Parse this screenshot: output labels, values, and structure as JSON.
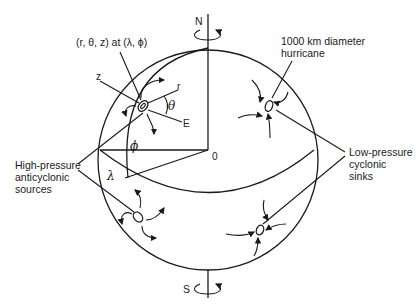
{
  "diagram": {
    "type": "earth-sphere-coordinate-diagram",
    "poles": {
      "north": "N",
      "south": "S"
    },
    "origin_label": "0",
    "coordinate_label": "(r, θ, z) at (λ, ϕ)",
    "axis_labels": {
      "z": "z",
      "r": "r",
      "east": "E",
      "theta": "θ",
      "phi": "ϕ",
      "lambda": "λ"
    },
    "annotations": {
      "hurricane": [
        "1000 km diameter",
        "hurricane"
      ],
      "high_pressure": [
        "High-pressure",
        "anticyclonic",
        "sources"
      ],
      "low_pressure": [
        "Low-pressure",
        "cyclonic",
        "sinks"
      ]
    },
    "colors": {
      "ink": "#1a1a1a",
      "background": "#ffffff"
    }
  }
}
